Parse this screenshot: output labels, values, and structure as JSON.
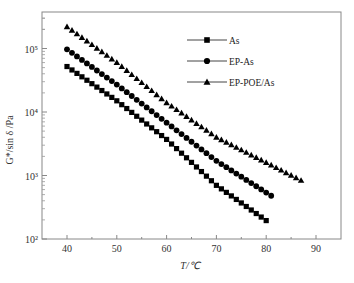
{
  "chart_data": {
    "type": "scatter",
    "title": "",
    "xlabel": "T/℃",
    "ylabel": "G*/sin δ /Pa",
    "xlim": [
      35,
      95
    ],
    "ylim": [
      100,
      316228
    ],
    "yscale": "log",
    "grid": false,
    "legend_position": "upper right",
    "x_ticks": [
      40,
      50,
      60,
      70,
      80,
      90
    ],
    "x_tick_labels": [
      "40",
      "50",
      "60",
      "70",
      "80",
      "90"
    ],
    "y_ticks": [
      100,
      1000,
      10000,
      100000
    ],
    "y_tick_labels": [
      "10²",
      "10³",
      "10⁴",
      "10⁵"
    ],
    "series": [
      {
        "name": "As",
        "marker": "square",
        "x_range": [
          40,
          80
        ],
        "points": [
          [
            40,
            52000
          ],
          [
            50,
            15000
          ],
          [
            60,
            3700
          ],
          [
            70,
            700
          ],
          [
            80,
            195
          ]
        ]
      },
      {
        "name": "EP-As",
        "marker": "circle",
        "x_range": [
          40,
          81
        ],
        "points": [
          [
            40,
            97000
          ],
          [
            50,
            27000
          ],
          [
            60,
            6800
          ],
          [
            70,
            1700
          ],
          [
            81,
            480
          ]
        ]
      },
      {
        "name": "EP-POE/As",
        "marker": "triangle",
        "x_range": [
          40,
          87.5
        ],
        "points": [
          [
            40,
            220000
          ],
          [
            50,
            60000
          ],
          [
            60,
            14000
          ],
          [
            70,
            4000
          ],
          [
            80,
            1600
          ],
          [
            87.5,
            800
          ]
        ]
      }
    ]
  },
  "legend": {
    "items": [
      {
        "label": "As",
        "marker": "square"
      },
      {
        "label": "EP-As",
        "marker": "circle"
      },
      {
        "label": "EP-POE/As",
        "marker": "triangle"
      }
    ]
  },
  "axes": {
    "xlabel": "T/℃",
    "ylabel": "G*/sin δ /Pa"
  }
}
